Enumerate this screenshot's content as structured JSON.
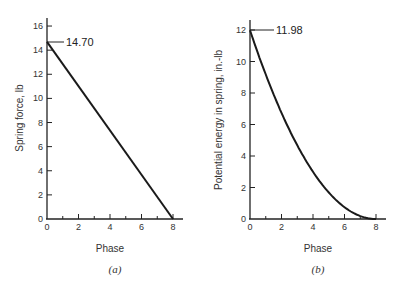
{
  "chart_data": [
    {
      "type": "line",
      "panel_label": "(a)",
      "title": "",
      "xlabel": "Phase",
      "ylabel": "Spring force, lb",
      "xlim": [
        0,
        8
      ],
      "ylim": [
        0,
        16
      ],
      "x_ticks": [
        "0",
        "2",
        "4",
        "6",
        "8"
      ],
      "y_ticks": [
        "0",
        "2",
        "4",
        "6",
        "8",
        "10",
        "12",
        "14",
        "16"
      ],
      "grid": false,
      "series": [
        {
          "name": "Spring force",
          "x": [
            0,
            8
          ],
          "y": [
            14.7,
            0
          ]
        }
      ],
      "annotations": [
        {
          "text": "14.70",
          "x": 0,
          "y": 14.7
        }
      ]
    },
    {
      "type": "line",
      "panel_label": "(b)",
      "title": "",
      "xlabel": "Phase",
      "ylabel": "Potential energy in spring, in.-lb",
      "xlim": [
        0,
        8
      ],
      "ylim": [
        0,
        12
      ],
      "x_ticks": [
        "0",
        "2",
        "4",
        "6",
        "8"
      ],
      "y_ticks": [
        "0",
        "2",
        "4",
        "6",
        "8",
        "10",
        "12"
      ],
      "grid": false,
      "series": [
        {
          "name": "Potential energy",
          "x": [
            0,
            1,
            2,
            3,
            4,
            5,
            6,
            7,
            8
          ],
          "y": [
            11.98,
            9.17,
            6.74,
            4.68,
            3.0,
            1.68,
            0.75,
            0.19,
            0
          ]
        }
      ],
      "annotations": [
        {
          "text": "11.98",
          "x": 0,
          "y": 11.98
        }
      ]
    }
  ],
  "figure": {
    "left_ylabel": "Spring force, lb",
    "right_ylabel": "Potential energy in spring, in.-lb",
    "left_xlabel": "Phase",
    "right_xlabel": "Phase",
    "left_panel": "(a)",
    "right_panel": "(b)",
    "left_annot": "14.70",
    "right_annot": "11.98",
    "left_xticks": [
      "0",
      "2",
      "4",
      "6",
      "8"
    ],
    "left_yticks": [
      "0",
      "2",
      "4",
      "6",
      "8",
      "10",
      "12",
      "14",
      "16"
    ],
    "right_xticks": [
      "0",
      "2",
      "4",
      "6",
      "8"
    ],
    "right_yticks": [
      "0",
      "2",
      "4",
      "6",
      "8",
      "10",
      "12"
    ]
  }
}
